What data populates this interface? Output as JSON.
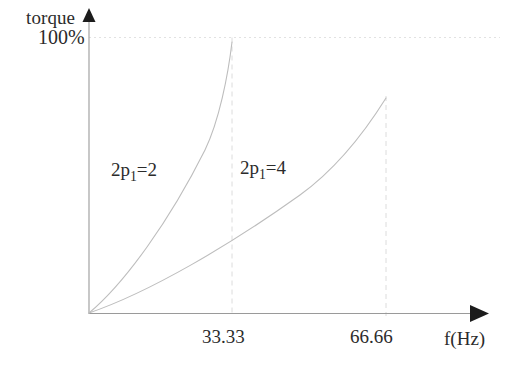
{
  "chart_data": {
    "type": "line",
    "title": "",
    "subtitle": "",
    "xlabel": "f(Hz)",
    "ylabel": "torque",
    "xlim": [
      0,
      89.3
    ],
    "ylim": [
      0,
      122
    ],
    "grid": false,
    "legend_position": "inline-annotations",
    "x_ticks": [
      {
        "value": 33.33,
        "label": "33.33"
      },
      {
        "value": 66.66,
        "label": "66.66"
      }
    ],
    "y_ticks": [
      {
        "value": 100,
        "label": "100%"
      }
    ],
    "annotations": [
      {
        "text": "2p1=2",
        "display": "2p₁=2",
        "x": 14.5,
        "y": 56
      },
      {
        "text": "2p1=4",
        "display": "2p₁=4",
        "x": 43.0,
        "y": 57
      }
    ],
    "reference_lines": [
      {
        "orientation": "horizontal",
        "value": 100,
        "style": "dotted",
        "label": "100%"
      },
      {
        "orientation": "vertical",
        "value": 33.33,
        "style": "dashed",
        "label": "33.33"
      },
      {
        "orientation": "vertical",
        "value": 66.66,
        "style": "dashed",
        "label": "66.66"
      }
    ],
    "series": [
      {
        "name": "2p1=2",
        "label": "2p₁=2",
        "color": "#b8b8b8",
        "x": [
          0,
          4.17,
          8.33,
          12.5,
          16.67,
          20.83,
          25.0,
          29.17,
          33.33
        ],
        "values": [
          0,
          9.5,
          20.5,
          32.5,
          45.5,
          59.5,
          74.0,
          88.5,
          100.0
        ]
      },
      {
        "name": "2p1=4",
        "label": "2p₁=4",
        "color": "#b8b8b8",
        "x": [
          0,
          8.33,
          16.66,
          25.0,
          33.33,
          41.66,
          50.0,
          58.33,
          66.66
        ],
        "values": [
          0,
          6.5,
          14.0,
          22.5,
          32.0,
          42.0,
          52.5,
          63.5,
          74.5
        ]
      }
    ]
  },
  "axes": {
    "y_axis_arrow_icon": "up-arrow-icon",
    "x_axis_arrow_icon": "right-arrow-icon"
  }
}
